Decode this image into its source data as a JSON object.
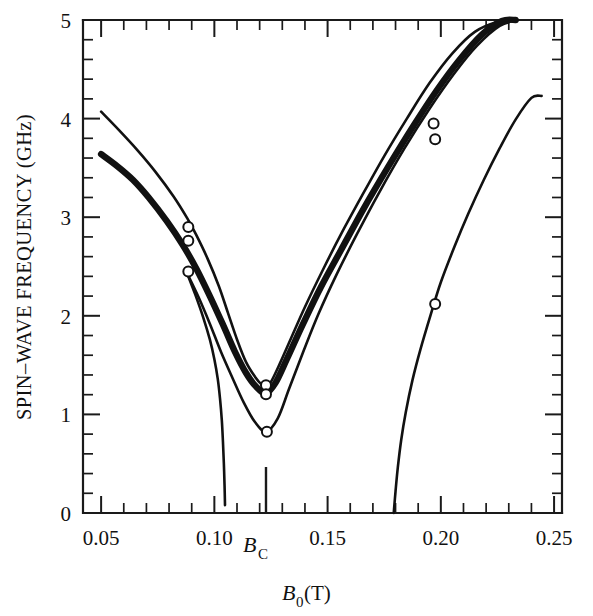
{
  "figure": {
    "background_color": "#ffffff",
    "ink_color": "#111111"
  },
  "chart_data": {
    "type": "line",
    "title": "",
    "xlabel": "B_0 (T)",
    "xlabel_base": "B",
    "xlabel_sub": "0",
    "xlabel_unit": " (T)",
    "ylabel": "SPIN–WAVE FREQUENCY (GHz)",
    "xlim": [
      0.042,
      0.2535
    ],
    "ylim": [
      0,
      5
    ],
    "grid": false,
    "legend": "none",
    "x_tick_labels": [
      "0.05",
      "0.10",
      "0.15",
      "0.20",
      "0.25"
    ],
    "x_tick_values": [
      0.05,
      0.1,
      0.15,
      0.2,
      0.25
    ],
    "x_minor_step": 0.01,
    "y_tick_labels": [
      "0",
      "1",
      "2",
      "3",
      "4",
      "5"
    ],
    "y_tick_values": [
      0,
      1,
      2,
      3,
      4,
      5
    ],
    "y_minor_step": 0.2,
    "special_tick": {
      "label": "B_C",
      "label_base": "B",
      "label_sub": "C",
      "value": 0.1228,
      "description": "critical field marker tick"
    },
    "series": [
      {
        "name": "upper branch (thin)",
        "style": "thin",
        "points": [
          [
            0.05,
            4.07
          ],
          [
            0.058,
            3.88
          ],
          [
            0.066,
            3.68
          ],
          [
            0.074,
            3.46
          ],
          [
            0.082,
            3.21
          ],
          [
            0.088,
            2.99
          ],
          [
            0.092,
            2.82
          ],
          [
            0.097,
            2.58
          ],
          [
            0.102,
            2.3
          ],
          [
            0.106,
            2.03
          ],
          [
            0.11,
            1.76
          ],
          [
            0.114,
            1.53
          ],
          [
            0.118,
            1.38
          ],
          [
            0.121,
            1.3
          ],
          [
            0.1228,
            1.285
          ],
          [
            0.125,
            1.33
          ],
          [
            0.129,
            1.52
          ],
          [
            0.134,
            1.78
          ],
          [
            0.14,
            2.09
          ],
          [
            0.148,
            2.47
          ],
          [
            0.156,
            2.83
          ],
          [
            0.165,
            3.21
          ],
          [
            0.175,
            3.62
          ],
          [
            0.185,
            4.0
          ],
          [
            0.195,
            4.36
          ],
          [
            0.205,
            4.66
          ],
          [
            0.215,
            4.88
          ],
          [
            0.225,
            4.98
          ],
          [
            0.234,
            5.0
          ]
        ]
      },
      {
        "name": "middle branch (thick band)",
        "style": "thick",
        "points": [
          [
            0.05,
            3.64
          ],
          [
            0.057,
            3.52
          ],
          [
            0.064,
            3.38
          ],
          [
            0.071,
            3.2
          ],
          [
            0.079,
            2.96
          ],
          [
            0.086,
            2.72
          ],
          [
            0.092,
            2.48
          ],
          [
            0.098,
            2.2
          ],
          [
            0.104,
            1.9
          ],
          [
            0.109,
            1.64
          ],
          [
            0.114,
            1.42
          ],
          [
            0.1185,
            1.28
          ],
          [
            0.1228,
            1.215
          ],
          [
            0.127,
            1.32
          ],
          [
            0.132,
            1.56
          ],
          [
            0.139,
            1.91
          ],
          [
            0.147,
            2.29
          ],
          [
            0.156,
            2.67
          ],
          [
            0.166,
            3.09
          ],
          [
            0.177,
            3.52
          ],
          [
            0.188,
            3.93
          ],
          [
            0.198,
            4.28
          ],
          [
            0.208,
            4.59
          ],
          [
            0.218,
            4.85
          ],
          [
            0.227,
            4.99
          ],
          [
            0.233,
            5.0
          ]
        ]
      },
      {
        "name": "lower branch (thin, deeper minimum)",
        "style": "thin",
        "points": [
          [
            0.088,
            2.43
          ],
          [
            0.093,
            2.19
          ],
          [
            0.098,
            1.92
          ],
          [
            0.103,
            1.63
          ],
          [
            0.108,
            1.37
          ],
          [
            0.113,
            1.12
          ],
          [
            0.118,
            0.92
          ],
          [
            0.1228,
            0.825
          ],
          [
            0.128,
            0.96
          ],
          [
            0.133,
            1.26
          ],
          [
            0.139,
            1.62
          ],
          [
            0.146,
            2.02
          ],
          [
            0.154,
            2.42
          ],
          [
            0.163,
            2.83
          ],
          [
            0.173,
            3.26
          ],
          [
            0.184,
            3.7
          ],
          [
            0.195,
            4.1
          ],
          [
            0.206,
            4.46
          ],
          [
            0.216,
            4.74
          ],
          [
            0.226,
            4.94
          ],
          [
            0.234,
            5.0
          ]
        ]
      },
      {
        "name": "left steep descending branch",
        "style": "thin",
        "points": [
          [
            0.088,
            2.43
          ],
          [
            0.0915,
            2.22
          ],
          [
            0.095,
            1.99
          ],
          [
            0.098,
            1.76
          ],
          [
            0.1,
            1.56
          ],
          [
            0.1015,
            1.36
          ],
          [
            0.1025,
            1.16
          ],
          [
            0.1033,
            0.94
          ],
          [
            0.1038,
            0.72
          ],
          [
            0.1042,
            0.5
          ],
          [
            0.1045,
            0.28
          ],
          [
            0.1047,
            0.08
          ]
        ]
      },
      {
        "name": "right ascending branch from zero",
        "style": "thin",
        "points": [
          [
            0.1792,
            0.0
          ],
          [
            0.18,
            0.22
          ],
          [
            0.181,
            0.46
          ],
          [
            0.1825,
            0.74
          ],
          [
            0.1845,
            1.02
          ],
          [
            0.1875,
            1.35
          ],
          [
            0.191,
            1.66
          ],
          [
            0.1955,
            2.01
          ],
          [
            0.2,
            2.34
          ],
          [
            0.206,
            2.7
          ],
          [
            0.212,
            3.03
          ],
          [
            0.219,
            3.38
          ],
          [
            0.226,
            3.7
          ],
          [
            0.233,
            3.99
          ],
          [
            0.24,
            4.21
          ],
          [
            0.2445,
            4.23
          ]
        ]
      }
    ],
    "markers": [
      {
        "x": 0.0885,
        "y": 2.9,
        "series": "upper branch (thin)"
      },
      {
        "x": 0.0885,
        "y": 2.76,
        "series": "middle branch (thick band)"
      },
      {
        "x": 0.0885,
        "y": 2.45,
        "series": "lower branch (thin, deeper minimum)"
      },
      {
        "x": 0.1228,
        "y": 1.295,
        "series": "upper branch (thin)"
      },
      {
        "x": 0.1228,
        "y": 1.205,
        "series": "middle branch (thick band)"
      },
      {
        "x": 0.1232,
        "y": 0.825,
        "series": "lower branch (thin, deeper minimum)"
      },
      {
        "x": 0.1968,
        "y": 3.95,
        "series": "upper branch (thin)"
      },
      {
        "x": 0.1975,
        "y": 3.79,
        "series": "middle branch (thick band)"
      },
      {
        "x": 0.1975,
        "y": 2.12,
        "series": "right ascending branch from zero"
      }
    ],
    "marker_style": {
      "shape": "open-circle",
      "fill": "#ffffff",
      "stroke": "#111111",
      "radius_px": 5
    }
  }
}
